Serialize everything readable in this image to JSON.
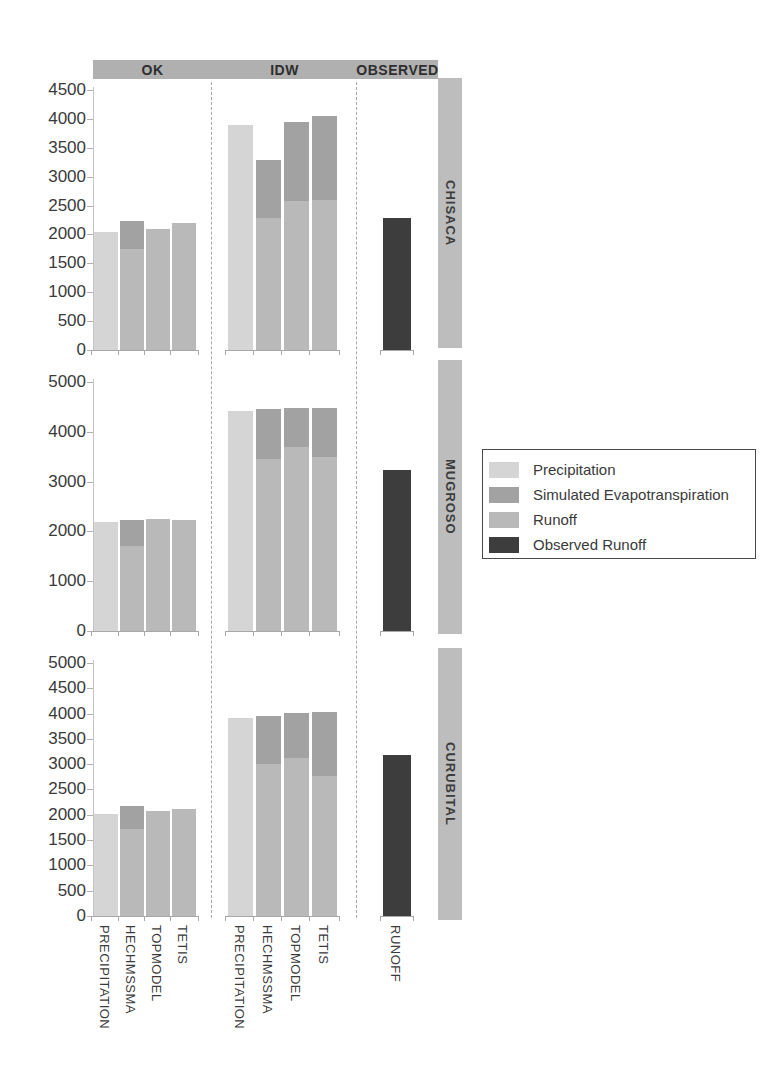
{
  "legend": {
    "items": [
      {
        "label": "Precipitation",
        "color": "#d5d5d5"
      },
      {
        "label": "Simulated Evapotranspiration",
        "color": "#a2a2a2"
      },
      {
        "label": "Runoff",
        "color": "#b9b9b9"
      },
      {
        "label": "Observed Runoff",
        "color": "#3d3d3d"
      }
    ]
  },
  "chart_data": [
    {
      "type": "bar",
      "stacked": true,
      "panel_label": "CHISACA",
      "ylim": [
        0,
        4500
      ],
      "ytick_step": 500,
      "grid": false,
      "groups": [
        {
          "name": "OK",
          "categories": [
            "PRECIPITATION",
            "HECHMSSMA",
            "TOPMODEL",
            "TETIS"
          ],
          "bars": [
            {
              "category": "PRECIPITATION",
              "segments": [
                {
                  "series": "Precipitation",
                  "value": 2050
                }
              ]
            },
            {
              "category": "HECHMSSMA",
              "segments": [
                {
                  "series": "Runoff",
                  "value": 1750
                },
                {
                  "series": "Simulated Evapotranspiration",
                  "value": 480
                }
              ]
            },
            {
              "category": "TOPMODEL",
              "segments": [
                {
                  "series": "Runoff",
                  "value": 2100
                }
              ]
            },
            {
              "category": "TETIS",
              "segments": [
                {
                  "series": "Runoff",
                  "value": 2190
                }
              ]
            }
          ]
        },
        {
          "name": "IDW",
          "categories": [
            "PRECIPITATION",
            "HECHMSSMA",
            "TOPMODEL",
            "TETIS"
          ],
          "bars": [
            {
              "category": "PRECIPITATION",
              "segments": [
                {
                  "series": "Precipitation",
                  "value": 3900
                }
              ]
            },
            {
              "category": "HECHMSSMA",
              "segments": [
                {
                  "series": "Runoff",
                  "value": 2290
                },
                {
                  "series": "Simulated Evapotranspiration",
                  "value": 990
                }
              ]
            },
            {
              "category": "TOPMODEL",
              "segments": [
                {
                  "series": "Runoff",
                  "value": 2580
                },
                {
                  "series": "Simulated Evapotranspiration",
                  "value": 1370
                }
              ]
            },
            {
              "category": "TETIS",
              "segments": [
                {
                  "series": "Runoff",
                  "value": 2600
                },
                {
                  "series": "Simulated Evapotranspiration",
                  "value": 1450
                }
              ]
            }
          ]
        },
        {
          "name": "OBSERVED",
          "categories": [
            "RUNOFF"
          ],
          "bars": [
            {
              "category": "RUNOFF",
              "segments": [
                {
                  "series": "Observed Runoff",
                  "value": 2290
                }
              ]
            }
          ]
        }
      ]
    },
    {
      "type": "bar",
      "stacked": true,
      "panel_label": "MUGROSO",
      "ylim": [
        0,
        5000
      ],
      "ytick_step": 1000,
      "grid": false,
      "groups": [
        {
          "name": "OK",
          "categories": [
            "PRECIPITATION",
            "HECHMSSMA",
            "TOPMODEL",
            "TETIS"
          ],
          "bars": [
            {
              "category": "PRECIPITATION",
              "segments": [
                {
                  "series": "Precipitation",
                  "value": 2180
                }
              ]
            },
            {
              "category": "HECHMSSMA",
              "segments": [
                {
                  "series": "Runoff",
                  "value": 1700
                },
                {
                  "series": "Simulated Evapotranspiration",
                  "value": 520
                }
              ]
            },
            {
              "category": "TOPMODEL",
              "segments": [
                {
                  "series": "Runoff",
                  "value": 2250
                }
              ]
            },
            {
              "category": "TETIS",
              "segments": [
                {
                  "series": "Runoff",
                  "value": 2230
                }
              ]
            }
          ]
        },
        {
          "name": "IDW",
          "categories": [
            "PRECIPITATION",
            "HECHMSSMA",
            "TOPMODEL",
            "TETIS"
          ],
          "bars": [
            {
              "category": "PRECIPITATION",
              "segments": [
                {
                  "series": "Precipitation",
                  "value": 4420
                }
              ]
            },
            {
              "category": "HECHMSSMA",
              "segments": [
                {
                  "series": "Runoff",
                  "value": 3450
                },
                {
                  "series": "Simulated Evapotranspiration",
                  "value": 1000
                }
              ]
            },
            {
              "category": "TOPMODEL",
              "segments": [
                {
                  "series": "Runoff",
                  "value": 3700
                },
                {
                  "series": "Simulated Evapotranspiration",
                  "value": 780
                }
              ]
            },
            {
              "category": "TETIS",
              "segments": [
                {
                  "series": "Runoff",
                  "value": 3500
                },
                {
                  "series": "Simulated Evapotranspiration",
                  "value": 980
                }
              ]
            }
          ]
        },
        {
          "name": "OBSERVED",
          "categories": [
            "RUNOFF"
          ],
          "bars": [
            {
              "category": "RUNOFF",
              "segments": [
                {
                  "series": "Observed Runoff",
                  "value": 3240
                }
              ]
            }
          ]
        }
      ]
    },
    {
      "type": "bar",
      "stacked": true,
      "panel_label": "CURUBITAL",
      "ylim": [
        0,
        5000
      ],
      "ytick_step": 500,
      "grid": false,
      "groups": [
        {
          "name": "OK",
          "categories": [
            "PRECIPITATION",
            "HECHMSSMA",
            "TOPMODEL",
            "TETIS"
          ],
          "bars": [
            {
              "category": "PRECIPITATION",
              "segments": [
                {
                  "series": "Precipitation",
                  "value": 2020
                }
              ]
            },
            {
              "category": "HECHMSSMA",
              "segments": [
                {
                  "series": "Runoff",
                  "value": 1720
                },
                {
                  "series": "Simulated Evapotranspiration",
                  "value": 450
                }
              ]
            },
            {
              "category": "TOPMODEL",
              "segments": [
                {
                  "series": "Runoff",
                  "value": 2070
                }
              ]
            },
            {
              "category": "TETIS",
              "segments": [
                {
                  "series": "Runoff",
                  "value": 2120
                }
              ]
            }
          ]
        },
        {
          "name": "IDW",
          "categories": [
            "PRECIPITATION",
            "HECHMSSMA",
            "TOPMODEL",
            "TETIS"
          ],
          "bars": [
            {
              "category": "PRECIPITATION",
              "segments": [
                {
                  "series": "Precipitation",
                  "value": 3920
                }
              ]
            },
            {
              "category": "HECHMSSMA",
              "segments": [
                {
                  "series": "Runoff",
                  "value": 3010
                },
                {
                  "series": "Simulated Evapotranspiration",
                  "value": 950
                }
              ]
            },
            {
              "category": "TOPMODEL",
              "segments": [
                {
                  "series": "Runoff",
                  "value": 3130
                },
                {
                  "series": "Simulated Evapotranspiration",
                  "value": 890
                }
              ]
            },
            {
              "category": "TETIS",
              "segments": [
                {
                  "series": "Runoff",
                  "value": 2760
                },
                {
                  "series": "Simulated Evapotranspiration",
                  "value": 1280
                }
              ]
            }
          ]
        },
        {
          "name": "OBSERVED",
          "categories": [
            "RUNOFF"
          ],
          "bars": [
            {
              "category": "RUNOFF",
              "segments": [
                {
                  "series": "Observed Runoff",
                  "value": 3180
                }
              ]
            }
          ]
        }
      ]
    }
  ]
}
